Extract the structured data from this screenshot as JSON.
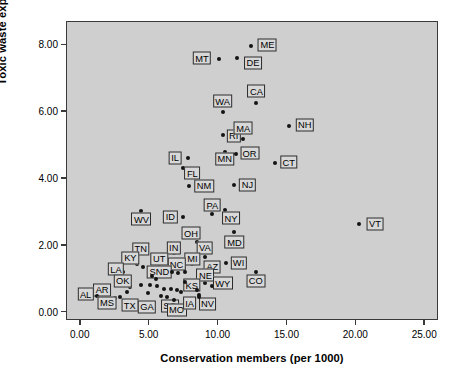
{
  "chart_data": {
    "type": "scatter",
    "title": "",
    "xlabel": "Conservation members (per 1000)",
    "ylabel": "Toxic waste expenditures",
    "xlim": [
      -1.0,
      26.0
    ],
    "ylim": [
      -0.25,
      8.7
    ],
    "xticks": [
      "0.00",
      "5.00",
      "10.00",
      "15.00",
      "20.00",
      "25.00"
    ],
    "xtick_values": [
      0,
      5,
      10,
      15,
      20,
      25
    ],
    "yticks": [
      "0.00",
      "2.00",
      "4.00",
      "6.00",
      "8.00"
    ],
    "ytick_values": [
      0,
      2,
      4,
      6,
      8
    ],
    "grid": false,
    "legend": "none",
    "plot_background": "#cfcfcf",
    "marker_color": "#141414",
    "label_box_fill": "#d8d8d8",
    "label_box_border": "#2b2b2b",
    "points": [
      {
        "label": "ME",
        "x": 12.35,
        "y": 7.98,
        "lx": 13.55,
        "ly": 8.02
      },
      {
        "label": "MT",
        "x": 10.0,
        "y": 7.6,
        "lx": 8.8,
        "ly": 7.62
      },
      {
        "label": "DE",
        "x": 11.35,
        "y": 7.62,
        "lx": 12.5,
        "ly": 7.48
      },
      {
        "label": "CA",
        "x": 12.75,
        "y": 6.28,
        "lx": 12.75,
        "ly": 6.62
      },
      {
        "label": "WA",
        "x": 10.3,
        "y": 6.0,
        "lx": 10.3,
        "ly": 6.33
      },
      {
        "label": "NH",
        "x": 15.1,
        "y": 5.6,
        "lx": 16.25,
        "ly": 5.62
      },
      {
        "label": "RI",
        "x": 10.3,
        "y": 5.32,
        "lx": 11.1,
        "ly": 5.3
      },
      {
        "label": "MA",
        "x": 11.75,
        "y": 5.2,
        "lx": 11.8,
        "ly": 5.52
      },
      {
        "label": "MN",
        "x": 10.45,
        "y": 4.82,
        "lx": 10.45,
        "ly": 4.6
      },
      {
        "label": "OR",
        "x": 11.25,
        "y": 4.75,
        "lx": 12.25,
        "ly": 4.77
      },
      {
        "label": "CT",
        "x": 14.1,
        "y": 4.48,
        "lx": 15.1,
        "ly": 4.5
      },
      {
        "label": "IL",
        "x": 7.75,
        "y": 4.62,
        "lx": 6.85,
        "ly": 4.64
      },
      {
        "label": "FL",
        "x": 7.4,
        "y": 4.32,
        "lx": 8.1,
        "ly": 4.18
      },
      {
        "label": "NM",
        "x": 7.85,
        "y": 3.78,
        "lx": 8.95,
        "ly": 3.8
      },
      {
        "label": "NJ",
        "x": 11.1,
        "y": 3.83,
        "lx": 12.1,
        "ly": 3.83
      },
      {
        "label": "PA",
        "x": 9.55,
        "y": 2.95,
        "lx": 9.55,
        "ly": 3.22
      },
      {
        "label": "NY",
        "x": 10.5,
        "y": 3.08,
        "lx": 10.9,
        "ly": 2.82
      },
      {
        "label": "WV",
        "x": 4.4,
        "y": 3.05,
        "lx": 4.4,
        "ly": 2.8
      },
      {
        "label": "ID",
        "x": 7.45,
        "y": 2.85,
        "lx": 6.5,
        "ly": 2.87
      },
      {
        "label": "VT",
        "x": 20.2,
        "y": 2.66,
        "lx": 21.35,
        "ly": 2.66
      },
      {
        "label": "MD",
        "x": 11.15,
        "y": 2.4,
        "lx": 11.15,
        "ly": 2.1
      },
      {
        "label": "OH",
        "x": 8.45,
        "y": 2.12,
        "lx": 8.0,
        "ly": 2.38
      },
      {
        "label": "IN",
        "x": 6.75,
        "y": 1.78,
        "lx": 6.75,
        "ly": 1.94
      },
      {
        "label": "TN",
        "x": 4.35,
        "y": 1.78,
        "lx": 4.35,
        "ly": 1.92
      },
      {
        "label": "VA",
        "x": 9.0,
        "y": 1.68,
        "lx": 9.0,
        "ly": 1.94
      },
      {
        "label": "KY",
        "x": 4.05,
        "y": 1.45,
        "lx": 3.6,
        "ly": 1.64
      },
      {
        "label": "UT",
        "x": 5.7,
        "y": 1.45,
        "lx": 5.7,
        "ly": 1.62
      },
      {
        "label": "MI",
        "x": 8.1,
        "y": 1.45,
        "lx": 8.1,
        "ly": 1.62
      },
      {
        "label": "WI",
        "x": 10.55,
        "y": 1.5,
        "lx": 11.45,
        "ly": 1.5
      },
      {
        "label": "NC",
        "x": 7.05,
        "y": 1.2,
        "lx": 6.95,
        "ly": 1.45
      },
      {
        "label": "AZ",
        "x": 9.3,
        "y": 1.3,
        "lx": 9.55,
        "ly": 1.38
      },
      {
        "label": "LA",
        "x": 3.05,
        "y": 1.22,
        "lx": 2.55,
        "ly": 1.3
      },
      {
        "label": "SND",
        "x": 5.95,
        "y": 1.12,
        "lx": 5.7,
        "ly": 1.22
      },
      {
        "label": "CO",
        "x": 12.7,
        "y": 1.22,
        "lx": 12.7,
        "ly": 0.95
      },
      {
        "label": "NE",
        "x": 9.05,
        "y": 0.88,
        "lx": 9.05,
        "ly": 1.12
      },
      {
        "label": "OK",
        "x": 3.6,
        "y": 0.78,
        "lx": 3.05,
        "ly": 0.95
      },
      {
        "label": "KS",
        "x": 8.15,
        "y": 0.72,
        "lx": 8.05,
        "ly": 0.82
      },
      {
        "label": "WY",
        "x": 9.55,
        "y": 0.8,
        "lx": 10.3,
        "ly": 0.88
      },
      {
        "label": "AR",
        "x": 2.05,
        "y": 0.58,
        "lx": 1.55,
        "ly": 0.68
      },
      {
        "label": "AL",
        "x": 1.15,
        "y": 0.5,
        "lx": 0.35,
        "ly": 0.55
      },
      {
        "label": "MS",
        "x": 2.45,
        "y": 0.45,
        "lx": 1.9,
        "ly": 0.3
      },
      {
        "label": "TX",
        "x": 3.95,
        "y": 0.35,
        "lx": 3.55,
        "ly": 0.22
      },
      {
        "label": "GA",
        "x": 5.05,
        "y": 0.3,
        "lx": 4.8,
        "ly": 0.18
      },
      {
        "label": "SC",
        "x": 6.3,
        "y": 0.3,
        "lx": 6.45,
        "ly": 0.2
      },
      {
        "label": "MO",
        "x": 6.8,
        "y": 0.38,
        "lx": 6.95,
        "ly": 0.08
      },
      {
        "label": "IA",
        "x": 7.6,
        "y": 0.42,
        "lx": 7.9,
        "ly": 0.28
      },
      {
        "label": "NV",
        "x": 8.6,
        "y": 0.52,
        "lx": 9.2,
        "ly": 0.26
      }
    ],
    "extra_points": [
      {
        "x": 4.55,
        "y": 1.38
      },
      {
        "x": 5.15,
        "y": 1.1
      },
      {
        "x": 5.45,
        "y": 1.02
      },
      {
        "x": 5.05,
        "y": 0.82
      },
      {
        "x": 5.55,
        "y": 0.8
      },
      {
        "x": 4.35,
        "y": 0.82
      },
      {
        "x": 6.05,
        "y": 0.72
      },
      {
        "x": 6.55,
        "y": 0.7
      },
      {
        "x": 6.95,
        "y": 0.68
      },
      {
        "x": 7.25,
        "y": 0.62
      },
      {
        "x": 7.6,
        "y": 0.92
      },
      {
        "x": 8.4,
        "y": 0.68
      },
      {
        "x": 6.6,
        "y": 1.22
      },
      {
        "x": 7.55,
        "y": 1.22
      },
      {
        "x": 8.55,
        "y": 0.48
      },
      {
        "x": 4.9,
        "y": 0.58
      },
      {
        "x": 5.8,
        "y": 0.5
      },
      {
        "x": 3.35,
        "y": 0.62
      },
      {
        "x": 2.85,
        "y": 0.48
      },
      {
        "x": 6.25,
        "y": 0.48
      }
    ]
  }
}
